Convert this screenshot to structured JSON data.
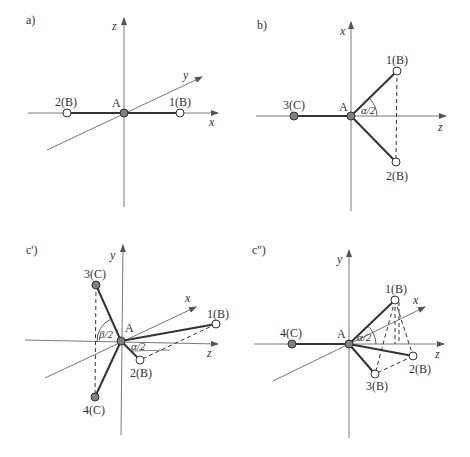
{
  "colors": {
    "axis": "#555555",
    "bond": "#333333",
    "filled_atom": "#808080",
    "open_atom": "#ffffff",
    "text": "#333333"
  },
  "panels": [
    {
      "id": "a",
      "label": "a)",
      "axes": [
        {
          "name": "z",
          "dir": "up"
        },
        {
          "name": "x",
          "dir": "right"
        },
        {
          "name": "y",
          "dir": "oblique"
        }
      ],
      "center": "A",
      "atoms": [
        {
          "label": "2(B)",
          "type": "open"
        },
        {
          "label": "1(B)",
          "type": "open"
        }
      ],
      "geometry": "linear"
    },
    {
      "id": "b",
      "label": "b)",
      "axes": [
        {
          "name": "x",
          "dir": "up"
        },
        {
          "name": "z",
          "dir": "right"
        }
      ],
      "center": "A",
      "atoms": [
        {
          "label": "3(C)",
          "type": "filled"
        },
        {
          "label": "1(B)",
          "type": "open"
        },
        {
          "label": "2(B)",
          "type": "open"
        }
      ],
      "angle": "α/2",
      "geometry": "trigonal planar"
    },
    {
      "id": "c1",
      "label": "c')",
      "axes": [
        {
          "name": "y",
          "dir": "up"
        },
        {
          "name": "z",
          "dir": "right"
        },
        {
          "name": "x",
          "dir": "oblique"
        }
      ],
      "center": "A",
      "atoms": [
        {
          "label": "3(C)",
          "type": "filled"
        },
        {
          "label": "4(C)",
          "type": "filled"
        },
        {
          "label": "1(B)",
          "type": "open"
        },
        {
          "label": "2(B)",
          "type": "open"
        }
      ],
      "angles": [
        "β/2",
        "α/2"
      ],
      "geometry": "tetrahedral"
    },
    {
      "id": "c2",
      "label": "c'')",
      "axes": [
        {
          "name": "y",
          "dir": "up"
        },
        {
          "name": "z",
          "dir": "right"
        },
        {
          "name": "x",
          "dir": "oblique"
        }
      ],
      "center": "A",
      "atoms": [
        {
          "label": "4(C)",
          "type": "filled"
        },
        {
          "label": "1(B)",
          "type": "open"
        },
        {
          "label": "2(B)",
          "type": "open"
        },
        {
          "label": "3(B)",
          "type": "open"
        }
      ],
      "angle": "α/2",
      "geometry": "trigonal pyramidal"
    }
  ]
}
